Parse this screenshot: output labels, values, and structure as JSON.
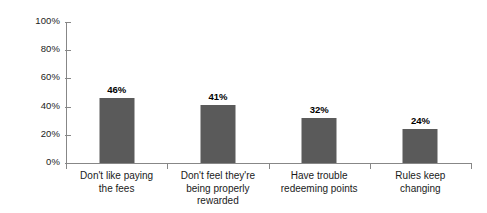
{
  "chart_data": {
    "type": "bar",
    "title": "",
    "subtitle": "",
    "xlabel": "",
    "ylabel": "",
    "ylim": [
      0,
      100
    ],
    "grid": false,
    "legend": false,
    "legend_position": "none",
    "orientation": "vertical",
    "categories": [
      "Don't like paying\nthe fees",
      "Don't feel they're\nbeing properly\nrewarded",
      "Have trouble\nredeeming points",
      "Rules keep\nchanging"
    ],
    "values": [
      46,
      41,
      32,
      24
    ],
    "value_labels": [
      "46%",
      "41%",
      "32%",
      "24%"
    ],
    "ytick_labels": [
      "0%",
      "20%",
      "40%",
      "60%",
      "80%",
      "100%"
    ],
    "ytick_values": [
      0,
      20,
      40,
      60,
      80,
      100
    ],
    "colors": {
      "bar": "#5a5a5a",
      "axis": "#878787",
      "text": "#1a1a1a",
      "background": "#ffffff"
    }
  }
}
